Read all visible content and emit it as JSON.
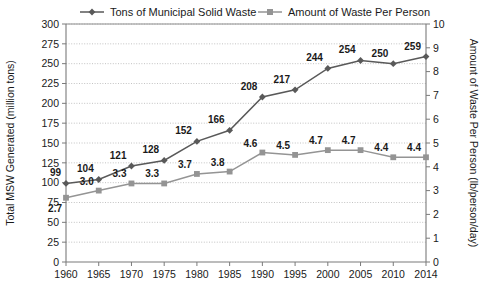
{
  "chart_data": {
    "type": "line",
    "title": "",
    "xlabel": "",
    "categories": [
      "1960",
      "1965",
      "1970",
      "1975",
      "1980",
      "1985",
      "1990",
      "1995",
      "2000",
      "2005",
      "2010",
      "2014"
    ],
    "grid": true,
    "legend_position": "top",
    "series": [
      {
        "name": "Tons of Municipal Solid Waste",
        "axis": "left",
        "marker": "diamond",
        "color": "#595959",
        "values": [
          99,
          104,
          121,
          128,
          152,
          166,
          208,
          217,
          244,
          254,
          250,
          259
        ],
        "labels": [
          "99",
          "104",
          "121",
          "128",
          "152",
          "166",
          "208",
          "217",
          "244",
          "254",
          "250",
          "259"
        ]
      },
      {
        "name": "Amount of Waste Per Person",
        "axis": "right",
        "marker": "square",
        "color": "#949494",
        "values": [
          2.7,
          3.0,
          3.3,
          3.3,
          3.7,
          3.8,
          4.6,
          4.5,
          4.7,
          4.7,
          4.4,
          4.4
        ],
        "labels": [
          "2.7",
          "3.0",
          "3.3",
          "3.3",
          "3.7",
          "3.8",
          "4.6",
          "4.5",
          "4.7",
          "4.7",
          "4.4",
          "4.4"
        ]
      }
    ],
    "left_axis": {
      "label": "Total MSW Generated (million tons)",
      "ylim": [
        0,
        300
      ],
      "ticks": [
        0,
        25,
        50,
        75,
        100,
        125,
        150,
        175,
        200,
        225,
        250,
        275,
        300
      ],
      "tick_labels": [
        "0",
        "25",
        "50",
        "75",
        "100",
        "125",
        "150",
        "175",
        "200",
        "225",
        "250",
        "275",
        "300"
      ]
    },
    "right_axis": {
      "label": "Amount of Waste Per Person (lb/person/day)",
      "ylim": [
        0,
        10
      ],
      "ticks": [
        0,
        1,
        2,
        3,
        4,
        5,
        6,
        7,
        8,
        9,
        10
      ],
      "tick_labels": [
        "0",
        "1",
        "2",
        "3",
        "4",
        "5",
        "6",
        "7",
        "8",
        "9",
        "10"
      ]
    }
  }
}
